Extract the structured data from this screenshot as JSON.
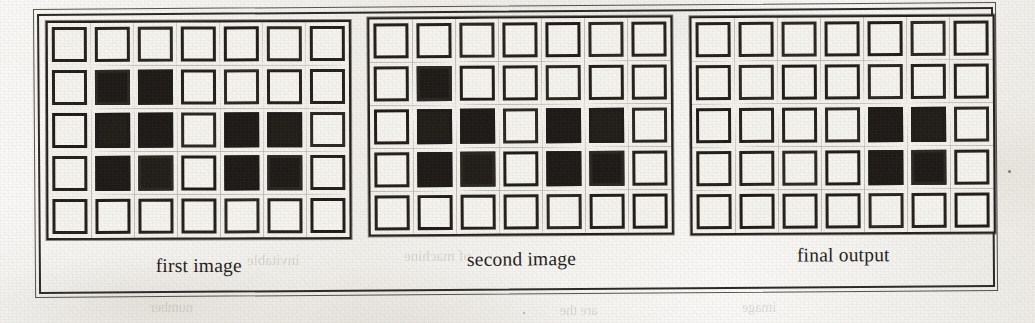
{
  "figure": {
    "caption_font_style": "serif",
    "grid_rows": 5,
    "grid_cols": 7,
    "on_color": "#1d1a17",
    "off_color": "#f5f3ee",
    "border_color": "#231f1b"
  },
  "panels": [
    {
      "id": "first-image",
      "label": "first image",
      "grid": [
        [
          0,
          0,
          0,
          0,
          0,
          0,
          0
        ],
        [
          0,
          1,
          1,
          0,
          0,
          0,
          0
        ],
        [
          0,
          1,
          1,
          0,
          1,
          1,
          0
        ],
        [
          0,
          1,
          1,
          0,
          1,
          1,
          0
        ],
        [
          0,
          0,
          0,
          0,
          0,
          0,
          0
        ]
      ]
    },
    {
      "id": "second-image",
      "label": "second image",
      "grid": [
        [
          0,
          0,
          0,
          0,
          0,
          0,
          0
        ],
        [
          0,
          1,
          0,
          0,
          0,
          0,
          0
        ],
        [
          0,
          1,
          1,
          0,
          1,
          1,
          0
        ],
        [
          0,
          1,
          1,
          0,
          1,
          1,
          0
        ],
        [
          0,
          0,
          0,
          0,
          0,
          0,
          0
        ]
      ]
    },
    {
      "id": "final-output",
      "label": "final output",
      "grid": [
        [
          0,
          0,
          0,
          0,
          0,
          0,
          0
        ],
        [
          0,
          0,
          0,
          0,
          0,
          0,
          0
        ],
        [
          0,
          0,
          0,
          0,
          1,
          1,
          0
        ],
        [
          0,
          0,
          0,
          0,
          1,
          1,
          0
        ],
        [
          0,
          0,
          0,
          0,
          0,
          0,
          0
        ]
      ]
    }
  ],
  "ghost_text": [
    {
      "text": "invitable",
      "x": 247,
      "y": 252,
      "size": 15
    },
    {
      "text": "of machine",
      "x": 404,
      "y": 248,
      "size": 15
    },
    {
      "text": "number",
      "x": 150,
      "y": 300,
      "size": 14
    },
    {
      "text": "are the",
      "x": 560,
      "y": 303,
      "size": 14
    },
    {
      "text": "image",
      "x": 742,
      "y": 300,
      "size": 14
    }
  ]
}
